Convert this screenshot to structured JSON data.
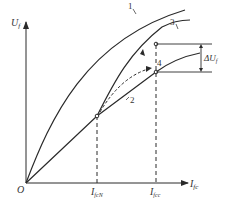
{
  "diagram": {
    "y_axis_label": "U",
    "y_axis_sub": "f",
    "x_axis_label": "I",
    "x_axis_sub": "fc",
    "origin_label": "O",
    "tick1_label": "I",
    "tick1_sub": "fcN",
    "tick2_label": "I",
    "tick2_sub": "fcc",
    "delta_label": "ΔU",
    "delta_sub": "f",
    "curve_labels": [
      "1",
      "2",
      "3",
      "4"
    ],
    "line_color": "#2a2a2a"
  }
}
